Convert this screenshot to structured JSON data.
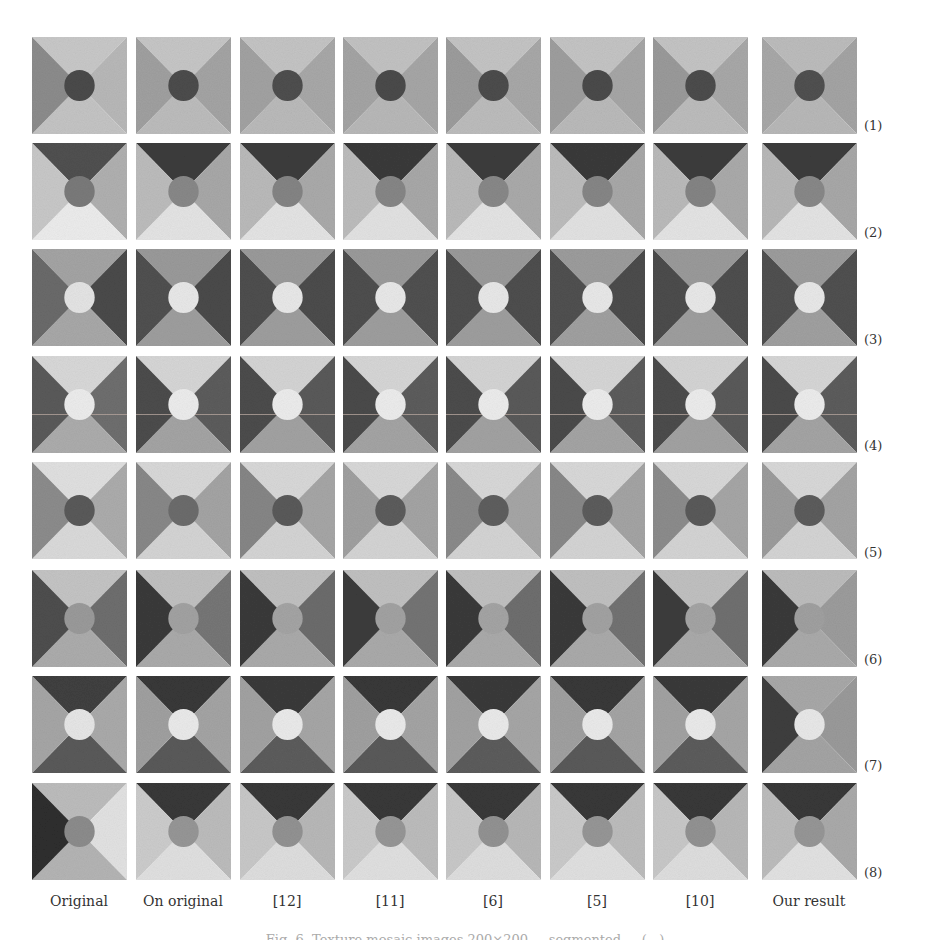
{
  "figure": {
    "column_labels": [
      "Original",
      "On original",
      "[12]",
      "[11]",
      "[6]",
      "[5]",
      "[10]",
      "Our result"
    ],
    "row_labels": [
      "(1)",
      "(2)",
      "(3)",
      "(4)",
      "(5)",
      "(6)",
      "(7)",
      "(8)"
    ],
    "caption_partial": "Fig. 6. Texture mosaic images 200×200 ... segmented ... (...)",
    "layout": {
      "col_x": [
        32,
        136,
        240,
        343,
        446,
        550,
        653,
        762
      ],
      "row_y": [
        37,
        143,
        249,
        356,
        462,
        570,
        676,
        783
      ],
      "label_y": [
        118,
        225,
        332,
        438,
        545,
        652,
        758,
        865
      ]
    },
    "rows": [
      {
        "label": "(1)",
        "tiles": [
          {
            "top": "#c8c8c8",
            "right": "#b8b8b8",
            "bottom": "#c4c4c4",
            "left": "#8c8c8c",
            "circle": "#4a4a4a",
            "tex": true
          },
          {
            "top": "#c6c6c6",
            "right": "#a4a4a4",
            "bottom": "#bcbcbc",
            "left": "#a0a0a0",
            "circle": "#4c4c4c"
          },
          {
            "top": "#c4c4c4",
            "right": "#a8a8a8",
            "bottom": "#bababa",
            "left": "#a2a2a2",
            "circle": "#4e4e4e"
          },
          {
            "top": "#c2c2c2",
            "right": "#a6a6a6",
            "bottom": "#b8b8b8",
            "left": "#a4a4a4",
            "circle": "#4a4a4a"
          },
          {
            "top": "#c4c4c4",
            "right": "#a8a8a8",
            "bottom": "#bcbcbc",
            "left": "#9c9c9c",
            "circle": "#4c4c4c"
          },
          {
            "top": "#c4c4c4",
            "right": "#a6a6a6",
            "bottom": "#bababa",
            "left": "#9e9e9e",
            "circle": "#4a4a4a"
          },
          {
            "top": "#c4c4c4",
            "right": "#a8a8a8",
            "bottom": "#bcbcbc",
            "left": "#9a9a9a",
            "circle": "#4c4c4c"
          },
          {
            "top": "#bcbcbc",
            "right": "#a4a4a4",
            "bottom": "#b8b8b8",
            "left": "#a8a8a8",
            "circle": "#505050"
          }
        ]
      },
      {
        "label": "(2)",
        "tiles": [
          {
            "top": "#505050",
            "right": "#b0b0b0",
            "bottom": "#ececec",
            "left": "#c8c8c8",
            "circle": "#7a7a7a",
            "tex": true
          },
          {
            "top": "#3c3c3c",
            "right": "#a8a8a8",
            "bottom": "#e4e4e4",
            "left": "#bcbcbc",
            "circle": "#888888"
          },
          {
            "top": "#3c3c3c",
            "right": "#aaaaaa",
            "bottom": "#e4e4e4",
            "left": "#bababa",
            "circle": "#848484"
          },
          {
            "top": "#3a3a3a",
            "right": "#a8a8a8",
            "bottom": "#e2e2e2",
            "left": "#bcbcbc",
            "circle": "#868686"
          },
          {
            "top": "#3c3c3c",
            "right": "#aaaaaa",
            "bottom": "#e4e4e4",
            "left": "#bababa",
            "circle": "#888888"
          },
          {
            "top": "#3a3a3a",
            "right": "#a8a8a8",
            "bottom": "#e2e2e2",
            "left": "#bcbcbc",
            "circle": "#868686"
          },
          {
            "top": "#3c3c3c",
            "right": "#aaaaaa",
            "bottom": "#e4e4e4",
            "left": "#bababa",
            "circle": "#848484"
          },
          {
            "top": "#3c3c3c",
            "right": "#a8a8a8",
            "bottom": "#e4e4e4",
            "left": "#b8b8b8",
            "circle": "#888888"
          }
        ]
      },
      {
        "label": "(3)",
        "tiles": [
          {
            "top": "#a4a4a4",
            "right": "#4a4a4a",
            "bottom": "#a8a8a8",
            "left": "#6a6a6a",
            "circle": "#e4e4e4",
            "tex": true
          },
          {
            "top": "#9a9a9a",
            "right": "#4a4a4a",
            "bottom": "#9e9e9e",
            "left": "#505050",
            "circle": "#e8e8e8"
          },
          {
            "top": "#9a9a9a",
            "right": "#4c4c4c",
            "bottom": "#9e9e9e",
            "left": "#4e4e4e",
            "circle": "#e8e8e8"
          },
          {
            "top": "#9a9a9a",
            "right": "#505050",
            "bottom": "#9e9e9e",
            "left": "#4e4e4e",
            "circle": "#e8e8e8"
          },
          {
            "top": "#9a9a9a",
            "right": "#4e4e4e",
            "bottom": "#9e9e9e",
            "left": "#4e4e4e",
            "circle": "#e8e8e8"
          },
          {
            "top": "#9c9c9c",
            "right": "#4c4c4c",
            "bottom": "#a0a0a0",
            "left": "#505050",
            "circle": "#e8e8e8"
          },
          {
            "top": "#9a9a9a",
            "right": "#4e4e4e",
            "bottom": "#9e9e9e",
            "left": "#4c4c4c",
            "circle": "#e8e8e8"
          },
          {
            "top": "#9c9c9c",
            "right": "#505050",
            "bottom": "#a0a0a0",
            "left": "#505050",
            "circle": "#e8e8e8"
          }
        ]
      },
      {
        "label": "(4)",
        "tiles": [
          {
            "top": "#d8d8d8",
            "right": "#6e6e6e",
            "bottom": "#acacac",
            "left": "#5a5a5a",
            "circle": "#ececec",
            "tex": true,
            "hline": true
          },
          {
            "top": "#d6d6d6",
            "right": "#5c5c5c",
            "bottom": "#a4a4a4",
            "left": "#4c4c4c",
            "circle": "#ececec",
            "hline": true
          },
          {
            "top": "#d4d4d4",
            "right": "#5a5a5a",
            "bottom": "#a2a2a2",
            "left": "#4c4c4c",
            "circle": "#ececec",
            "hline": true
          },
          {
            "top": "#d6d6d6",
            "right": "#5c5c5c",
            "bottom": "#a4a4a4",
            "left": "#4a4a4a",
            "circle": "#ececec",
            "hline": true
          },
          {
            "top": "#d4d4d4",
            "right": "#5a5a5a",
            "bottom": "#a2a2a2",
            "left": "#4c4c4c",
            "circle": "#ececec",
            "hline": true
          },
          {
            "top": "#d6d6d6",
            "right": "#5c5c5c",
            "bottom": "#a4a4a4",
            "left": "#4a4a4a",
            "circle": "#ececec",
            "hline": true
          },
          {
            "top": "#d4d4d4",
            "right": "#5a5a5a",
            "bottom": "#a2a2a2",
            "left": "#4c4c4c",
            "circle": "#ececec",
            "hline": true
          },
          {
            "top": "#d6d6d6",
            "right": "#5c5c5c",
            "bottom": "#a4a4a4",
            "left": "#4a4a4a",
            "circle": "#ececec",
            "hline": true
          }
        ]
      },
      {
        "label": "(5)",
        "tiles": [
          {
            "top": "#e0e0e0",
            "right": "#acacac",
            "bottom": "#dadada",
            "left": "#8c8c8c",
            "circle": "#5a5a5a",
            "tex": true
          },
          {
            "top": "#d8d8d8",
            "right": "#a4a4a4",
            "bottom": "#d4d4d4",
            "left": "#888888",
            "circle": "#6c6c6c"
          },
          {
            "top": "#d8d8d8",
            "right": "#a6a6a6",
            "bottom": "#d4d4d4",
            "left": "#868686",
            "circle": "#5a5a5a"
          },
          {
            "top": "#d8d8d8",
            "right": "#a4a4a4",
            "bottom": "#d4d4d4",
            "left": "#a0a0a0",
            "circle": "#5c5c5c"
          },
          {
            "top": "#d8d8d8",
            "right": "#a6a6a6",
            "bottom": "#d4d4d4",
            "left": "#8a8a8a",
            "circle": "#5e5e5e"
          },
          {
            "top": "#d8d8d8",
            "right": "#a4a4a4",
            "bottom": "#d4d4d4",
            "left": "#888888",
            "circle": "#5c5c5c"
          },
          {
            "top": "#d8d8d8",
            "right": "#a6a6a6",
            "bottom": "#d4d4d4",
            "left": "#8c8c8c",
            "circle": "#5a5a5a"
          },
          {
            "top": "#d8d8d8",
            "right": "#a4a4a4",
            "bottom": "#d4d4d4",
            "left": "#9c9c9c",
            "circle": "#5c5c5c"
          }
        ]
      },
      {
        "label": "(6)",
        "tiles": [
          {
            "top": "#c4c4c4",
            "right": "#6e6e6e",
            "bottom": "#acacac",
            "left": "#4e4e4e",
            "circle": "#9a9a9a",
            "tex": true
          },
          {
            "top": "#c0c0c0",
            "right": "#767676",
            "bottom": "#aaaaaa",
            "left": "#3a3a3a",
            "circle": "#a2a2a2"
          },
          {
            "top": "#c0c0c0",
            "right": "#6c6c6c",
            "bottom": "#aaaaaa",
            "left": "#3a3a3a",
            "circle": "#a4a4a4"
          },
          {
            "top": "#c0c0c0",
            "right": "#747474",
            "bottom": "#aaaaaa",
            "left": "#3c3c3c",
            "circle": "#a2a2a2"
          },
          {
            "top": "#c0c0c0",
            "right": "#6e6e6e",
            "bottom": "#aaaaaa",
            "left": "#3a3a3a",
            "circle": "#a4a4a4"
          },
          {
            "top": "#c0c0c0",
            "right": "#727272",
            "bottom": "#aaaaaa",
            "left": "#3a3a3a",
            "circle": "#a2a2a2"
          },
          {
            "top": "#c0c0c0",
            "right": "#707070",
            "bottom": "#aaaaaa",
            "left": "#3c3c3c",
            "circle": "#a4a4a4"
          },
          {
            "top": "#bcbcbc",
            "right": "#9c9c9c",
            "bottom": "#aaaaaa",
            "left": "#3a3a3a",
            "circle": "#a0a0a0"
          }
        ]
      },
      {
        "label": "(7)",
        "tiles": [
          {
            "top": "#404040",
            "right": "#aaaaaa",
            "bottom": "#5a5a5a",
            "left": "#a6a6a6",
            "circle": "#e6e6e6",
            "tex": true
          },
          {
            "top": "#383838",
            "right": "#a4a4a4",
            "bottom": "#5a5a5a",
            "left": "#a0a0a0",
            "circle": "#eaeaea"
          },
          {
            "top": "#3a3a3a",
            "right": "#a6a6a6",
            "bottom": "#5c5c5c",
            "left": "#a2a2a2",
            "circle": "#eaeaea"
          },
          {
            "top": "#383838",
            "right": "#a4a4a4",
            "bottom": "#5a5a5a",
            "left": "#a0a0a0",
            "circle": "#eaeaea"
          },
          {
            "top": "#3a3a3a",
            "right": "#a6a6a6",
            "bottom": "#5c5c5c",
            "left": "#a2a2a2",
            "circle": "#eaeaea"
          },
          {
            "top": "#383838",
            "right": "#a4a4a4",
            "bottom": "#5a5a5a",
            "left": "#a0a0a0",
            "circle": "#eaeaea"
          },
          {
            "top": "#3a3a3a",
            "right": "#a6a6a6",
            "bottom": "#5c5c5c",
            "left": "#a2a2a2",
            "circle": "#eaeaea"
          },
          {
            "top": "#a8a8a8",
            "right": "#9a9a9a",
            "bottom": "#a4a4a4",
            "left": "#3e3e3e",
            "circle": "#e8e8e8"
          }
        ]
      },
      {
        "label": "(8)",
        "tiles": [
          {
            "top": "#bcbcbc",
            "right": "#e2e2e2",
            "bottom": "#b4b4b4",
            "left": "#2e2e2e",
            "circle": "#8c8c8c",
            "tex": true
          },
          {
            "top": "#383838",
            "right": "#bcbcbc",
            "bottom": "#e0e0e0",
            "left": "#cccccc",
            "circle": "#969696"
          },
          {
            "top": "#383838",
            "right": "#b8b8b8",
            "bottom": "#dedede",
            "left": "#c8c8c8",
            "circle": "#929292"
          },
          {
            "top": "#383838",
            "right": "#bcbcbc",
            "bottom": "#e0e0e0",
            "left": "#cacaca",
            "circle": "#969696"
          },
          {
            "top": "#383838",
            "right": "#b8b8b8",
            "bottom": "#dedede",
            "left": "#c8c8c8",
            "circle": "#929292"
          },
          {
            "top": "#383838",
            "right": "#bcbcbc",
            "bottom": "#e0e0e0",
            "left": "#cacaca",
            "circle": "#969696"
          },
          {
            "top": "#383838",
            "right": "#b8b8b8",
            "bottom": "#dedede",
            "left": "#c8c8c8",
            "circle": "#929292"
          },
          {
            "top": "#383838",
            "right": "#aaaaaa",
            "bottom": "#e2e2e2",
            "left": "#bcbcbc",
            "circle": "#969696"
          }
        ]
      }
    ]
  }
}
